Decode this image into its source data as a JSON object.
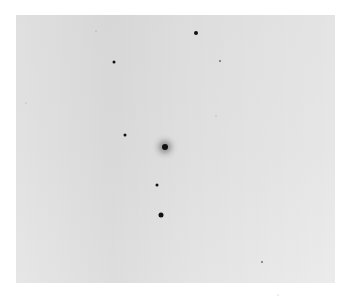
{
  "image": {
    "description": "Grayscale astronomical star field on light gray background",
    "background_color": "#e6e6e6",
    "star_color": "#111111"
  },
  "stars": [
    {
      "x": 196,
      "y": 33,
      "size": 4,
      "blur": 0
    },
    {
      "x": 114,
      "y": 62,
      "size": 3,
      "blur": 0
    },
    {
      "x": 220,
      "y": 61,
      "size": 2,
      "blur": 0
    },
    {
      "x": 125,
      "y": 135,
      "size": 3,
      "blur": 0
    },
    {
      "x": 165,
      "y": 147,
      "size": 6,
      "blur": 3
    },
    {
      "x": 157,
      "y": 185,
      "size": 3,
      "blur": 0
    },
    {
      "x": 161,
      "y": 215,
      "size": 5,
      "blur": 0
    },
    {
      "x": 96,
      "y": 31,
      "size": 1,
      "blur": 0
    },
    {
      "x": 26,
      "y": 103,
      "size": 1,
      "blur": 0
    },
    {
      "x": 216,
      "y": 116,
      "size": 1,
      "blur": 0
    },
    {
      "x": 262,
      "y": 262,
      "size": 2,
      "blur": 0
    },
    {
      "x": 278,
      "y": 295,
      "size": 1,
      "blur": 0
    }
  ]
}
